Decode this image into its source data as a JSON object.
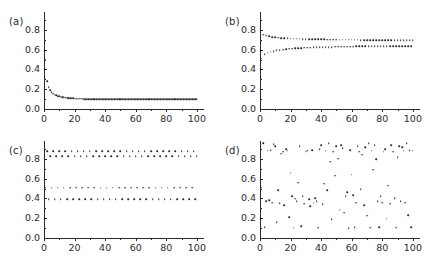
{
  "figure": {
    "background": "#ffffff",
    "point_color": "#2b2b2b",
    "axis_color": "#2b2b2b",
    "panel_tags": [
      "(a)",
      "(b)",
      "(c)",
      "(d)"
    ]
  },
  "axes": {
    "xlim": [
      0,
      104
    ],
    "ylim": [
      0.0,
      0.98
    ],
    "xticks": [
      0,
      20,
      40,
      60,
      80,
      100
    ],
    "xticklabels": [
      "0",
      "20",
      "40",
      "60",
      "80",
      "100"
    ],
    "xticks_minor": [
      10,
      30,
      50,
      70,
      90
    ],
    "yticks": [
      0.0,
      0.2,
      0.4,
      0.6,
      0.8
    ],
    "yticklabels": [
      "0.0",
      "0.2",
      "0.4",
      "0.6",
      "0.8"
    ],
    "yticks_minor": [
      0.1,
      0.3,
      0.5,
      0.7,
      0.9
    ],
    "grid": false,
    "legend": "none"
  },
  "chart_data": [
    {
      "type": "scatter",
      "panel": "(a)",
      "title": "",
      "xlabel": "",
      "ylabel": "",
      "xlim": [
        0,
        104
      ],
      "ylim": [
        0.0,
        0.98
      ],
      "regime": "stable fixed point",
      "series": [
        {
          "name": "orbit",
          "x": [
            1,
            2,
            3,
            4,
            5,
            6,
            7,
            8,
            9,
            10,
            11,
            12,
            13,
            14,
            15,
            16,
            17,
            18,
            19,
            20,
            21,
            22,
            23,
            24,
            25,
            26,
            27,
            28,
            29,
            30,
            31,
            32,
            33,
            34,
            35,
            36,
            37,
            38,
            39,
            40,
            41,
            42,
            43,
            44,
            45,
            46,
            47,
            48,
            49,
            50,
            51,
            52,
            53,
            54,
            55,
            56,
            57,
            58,
            59,
            60,
            61,
            62,
            63,
            64,
            65,
            66,
            67,
            68,
            69,
            70,
            71,
            72,
            73,
            74,
            75,
            76,
            77,
            78,
            79,
            80,
            81,
            82,
            83,
            84,
            85,
            86,
            87,
            88,
            89,
            90,
            91,
            92,
            93,
            94,
            95,
            96,
            97,
            98,
            99,
            100
          ],
          "y": [
            0.5,
            0.28,
            0.22,
            0.19,
            0.17,
            0.155,
            0.145,
            0.138,
            0.132,
            0.127,
            0.123,
            0.12,
            0.117,
            0.1145,
            0.1125,
            0.1108,
            0.1093,
            0.108,
            0.1068,
            0.1058,
            0.1049,
            0.1041,
            0.1034,
            0.1028,
            0.1022,
            0.1017,
            0.1013,
            0.1009,
            0.1005,
            0.1002,
            0.0999,
            0.0996,
            0.0994,
            0.0992,
            0.099,
            0.0988,
            0.0986,
            0.0985,
            0.0983,
            0.0982,
            0.0981,
            0.098,
            0.0979,
            0.0978,
            0.0977,
            0.0977,
            0.0976,
            0.0975,
            0.0975,
            0.0974,
            0.0974,
            0.0973,
            0.0973,
            0.0972,
            0.0972,
            0.0972,
            0.0971,
            0.0971,
            0.0971,
            0.0971,
            0.097,
            0.097,
            0.097,
            0.097,
            0.097,
            0.0969,
            0.0969,
            0.0969,
            0.0969,
            0.0969,
            0.0969,
            0.0969,
            0.0969,
            0.0968,
            0.0968,
            0.0968,
            0.0968,
            0.0968,
            0.0968,
            0.0968,
            0.0968,
            0.0968,
            0.0968,
            0.0968,
            0.0968,
            0.0968,
            0.0968,
            0.0968,
            0.0968,
            0.0968,
            0.0968,
            0.0968,
            0.0968,
            0.0968,
            0.0968,
            0.0968,
            0.0968,
            0.0968,
            0.0968,
            0.0968,
            0.0968
          ]
        }
      ]
    },
    {
      "type": "scatter",
      "panel": "(b)",
      "title": "",
      "xlabel": "",
      "ylabel": "",
      "xlim": [
        0,
        104
      ],
      "ylim": [
        0.0,
        0.98
      ],
      "regime": "period-2 orbit",
      "series": [
        {
          "name": "orbit",
          "x": [
            1,
            2,
            3,
            4,
            5,
            6,
            7,
            8,
            9,
            10,
            11,
            12,
            13,
            14,
            15,
            16,
            17,
            18,
            19,
            20,
            21,
            22,
            23,
            24,
            25,
            26,
            27,
            28,
            29,
            30,
            31,
            32,
            33,
            34,
            35,
            36,
            37,
            38,
            39,
            40,
            41,
            42,
            43,
            44,
            45,
            46,
            47,
            48,
            49,
            50,
            51,
            52,
            53,
            54,
            55,
            56,
            57,
            58,
            59,
            60,
            61,
            62,
            63,
            64,
            65,
            66,
            67,
            68,
            69,
            70,
            71,
            72,
            73,
            74,
            75,
            76,
            77,
            78,
            79,
            80,
            81,
            82,
            83,
            84,
            85,
            86,
            87,
            88,
            89,
            90,
            91,
            92,
            93,
            94,
            95,
            96,
            97,
            98,
            99,
            100
          ],
          "y": [
            0.51,
            0.752,
            0.552,
            0.74,
            0.567,
            0.733,
            0.578,
            0.728,
            0.586,
            0.724,
            0.592,
            0.721,
            0.597,
            0.718,
            0.601,
            0.716,
            0.605,
            0.714,
            0.608,
            0.712,
            0.61,
            0.711,
            0.613,
            0.71,
            0.615,
            0.709,
            0.617,
            0.708,
            0.618,
            0.707,
            0.62,
            0.706,
            0.621,
            0.705,
            0.622,
            0.705,
            0.623,
            0.704,
            0.624,
            0.703,
            0.625,
            0.703,
            0.626,
            0.702,
            0.627,
            0.702,
            0.627,
            0.701,
            0.628,
            0.701,
            0.629,
            0.701,
            0.629,
            0.7,
            0.63,
            0.7,
            0.63,
            0.7,
            0.631,
            0.699,
            0.631,
            0.699,
            0.632,
            0.699,
            0.632,
            0.698,
            0.632,
            0.698,
            0.633,
            0.698,
            0.633,
            0.698,
            0.633,
            0.697,
            0.634,
            0.697,
            0.634,
            0.697,
            0.634,
            0.697,
            0.635,
            0.697,
            0.635,
            0.696,
            0.635,
            0.696,
            0.635,
            0.696,
            0.636,
            0.696,
            0.636,
            0.696,
            0.636,
            0.696,
            0.636,
            0.695,
            0.636,
            0.695,
            0.637,
            0.695
          ]
        }
      ]
    },
    {
      "type": "scatter",
      "panel": "(c)",
      "title": "",
      "xlabel": "",
      "ylabel": "",
      "xlim": [
        0,
        104
      ],
      "ylim": [
        0.0,
        0.98
      ],
      "regime": "period-4 orbit",
      "bands": [
        0.875,
        0.825,
        0.51,
        0.39
      ],
      "series": [
        {
          "name": "orbit",
          "x": [
            1,
            2,
            3,
            4,
            5,
            6,
            7,
            8,
            9,
            10,
            11,
            12,
            13,
            14,
            15,
            16,
            17,
            18,
            19,
            20,
            21,
            22,
            23,
            24,
            25,
            26,
            27,
            28,
            29,
            30,
            31,
            32,
            33,
            34,
            35,
            36,
            37,
            38,
            39,
            40,
            41,
            42,
            43,
            44,
            45,
            46,
            47,
            48,
            49,
            50,
            51,
            52,
            53,
            54,
            55,
            56,
            57,
            58,
            59,
            60,
            61,
            62,
            63,
            64,
            65,
            66,
            67,
            68,
            69,
            70,
            71,
            72,
            73,
            74,
            75,
            76,
            77,
            78,
            79,
            80,
            81,
            82,
            83,
            84,
            85,
            86,
            87,
            88,
            89,
            90,
            91,
            92,
            93,
            94,
            95,
            96,
            97,
            98,
            99,
            100
          ],
          "y": [
            0.51,
            0.875,
            0.39,
            0.825,
            0.51,
            0.875,
            0.39,
            0.825,
            0.51,
            0.875,
            0.39,
            0.825,
            0.51,
            0.875,
            0.39,
            0.825,
            0.51,
            0.875,
            0.39,
            0.825,
            0.51,
            0.875,
            0.39,
            0.825,
            0.51,
            0.875,
            0.39,
            0.825,
            0.51,
            0.875,
            0.39,
            0.825,
            0.51,
            0.875,
            0.39,
            0.825,
            0.51,
            0.875,
            0.39,
            0.825,
            0.51,
            0.875,
            0.39,
            0.825,
            0.51,
            0.875,
            0.39,
            0.825,
            0.51,
            0.875,
            0.39,
            0.825,
            0.51,
            0.875,
            0.39,
            0.825,
            0.51,
            0.875,
            0.39,
            0.825,
            0.51,
            0.875,
            0.39,
            0.825,
            0.51,
            0.875,
            0.39,
            0.825,
            0.51,
            0.875,
            0.39,
            0.825,
            0.51,
            0.875,
            0.39,
            0.825,
            0.51,
            0.875,
            0.39,
            0.825,
            0.51,
            0.875,
            0.39,
            0.825,
            0.51,
            0.875,
            0.39,
            0.825,
            0.51,
            0.875,
            0.39,
            0.825,
            0.51,
            0.875,
            0.39,
            0.825,
            0.51,
            0.875,
            0.39,
            0.825
          ]
        }
      ]
    },
    {
      "type": "scatter",
      "panel": "(d)",
      "title": "",
      "xlabel": "",
      "ylabel": "",
      "xlim": [
        0,
        104
      ],
      "ylim": [
        0.0,
        0.98
      ],
      "regime": "chaotic",
      "series": [
        {
          "name": "orbit",
          "x": [
            1,
            2,
            3,
            4,
            5,
            6,
            7,
            8,
            9,
            10,
            11,
            12,
            13,
            14,
            15,
            16,
            17,
            18,
            19,
            20,
            21,
            22,
            23,
            24,
            25,
            26,
            27,
            28,
            29,
            30,
            31,
            32,
            33,
            34,
            35,
            36,
            37,
            38,
            39,
            40,
            41,
            42,
            43,
            44,
            45,
            46,
            47,
            48,
            49,
            50,
            51,
            52,
            53,
            54,
            55,
            56,
            57,
            58,
            59,
            60,
            61,
            62,
            63,
            64,
            65,
            66,
            67,
            68,
            69,
            70,
            71,
            72,
            73,
            74,
            75,
            76,
            77,
            78,
            79,
            80,
            81,
            82,
            83,
            84,
            85,
            86,
            87,
            88,
            89,
            90,
            91,
            92,
            93,
            94,
            95,
            96,
            97,
            98,
            99,
            100
          ],
          "y": [
            0.51,
            0.96,
            0.11,
            0.37,
            0.88,
            0.38,
            0.89,
            0.355,
            0.95,
            0.93,
            0.16,
            0.48,
            0.35,
            0.85,
            0.87,
            0.33,
            0.9,
            0.88,
            0.21,
            0.66,
            0.42,
            0.105,
            0.395,
            0.37,
            0.56,
            0.93,
            0.12,
            0.42,
            0.345,
            0.87,
            0.88,
            0.39,
            0.32,
            0.89,
            0.355,
            0.4,
            0.37,
            0.105,
            0.9,
            0.94,
            0.34,
            0.55,
            0.88,
            0.48,
            0.96,
            0.77,
            0.19,
            0.87,
            0.63,
            0.93,
            0.8,
            0.285,
            0.94,
            0.905,
            0.255,
            0.42,
            0.46,
            0.1,
            0.89,
            0.64,
            0.43,
            0.11,
            0.355,
            0.93,
            0.87,
            0.495,
            0.84,
            0.33,
            0.915,
            0.225,
            0.96,
            0.105,
            0.88,
            0.69,
            0.94,
            0.795,
            0.37,
            0.11,
            0.42,
            0.355,
            0.87,
            0.9,
            0.195,
            0.53,
            0.345,
            0.94,
            0.87,
            0.4,
            0.105,
            0.815,
            0.93,
            0.37,
            0.915,
            0.88,
            0.355,
            0.96,
            0.23,
            0.89,
            0.11,
            0.88
          ]
        }
      ]
    }
  ]
}
